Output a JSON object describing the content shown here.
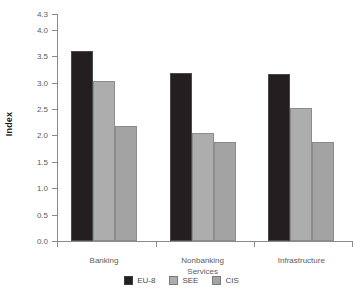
{
  "chart_data": {
    "type": "bar",
    "title": "",
    "subtitle": "",
    "xlabel": "",
    "ylabel": "Index",
    "categories": [
      "Banking",
      "Nonbanking\nServices",
      "Infrastructure"
    ],
    "series": [
      {
        "name": "EU-8",
        "color": "#231f20",
        "values": [
          3.6,
          3.18,
          3.17
        ]
      },
      {
        "name": "SEE",
        "color": "#adadad",
        "values": [
          3.03,
          2.05,
          2.52
        ]
      },
      {
        "name": "CIS",
        "color": "#a3a3a3",
        "values": [
          2.17,
          1.88,
          1.88
        ]
      }
    ],
    "ylim": [
      0.0,
      4.3
    ],
    "yticks": [
      0.0,
      0.5,
      1.0,
      1.5,
      2.0,
      2.5,
      3.0,
      3.5,
      4.0,
      4.3
    ],
    "ytick_labels": [
      "0.0",
      "0.5",
      "1.0",
      "1.5",
      "2.0",
      "2.5",
      "3.0",
      "3.5",
      "4.0",
      "4.3"
    ],
    "grid": false,
    "legend_position": "bottom",
    "axis_color": "#8a8a8a",
    "tick_label_color": "#5c5c5c"
  }
}
